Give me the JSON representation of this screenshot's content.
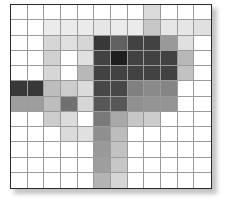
{
  "figure": {
    "kind": "grayscale-heatmap-image",
    "background_color": "#ffffff",
    "frame_border_color": "#2a2a2a",
    "gridline_color": "#9b9b9b",
    "shadow_color": "#b9b9b9"
  },
  "chart_data": {
    "type": "heatmap",
    "title": "",
    "subtitle": "",
    "xlabel": "",
    "ylabel": "",
    "grid": true,
    "legend": "none",
    "colormap": "grayscale",
    "value_range": [
      0,
      1
    ],
    "value_color_note": "0 = black, 1 = white",
    "rows": 12,
    "cols": 12,
    "x": [
      1,
      2,
      3,
      4,
      5,
      6,
      7,
      8,
      9,
      10,
      11,
      12
    ],
    "y": [
      1,
      2,
      3,
      4,
      5,
      6,
      7,
      8,
      9,
      10,
      11,
      12
    ],
    "xticklabels": [
      "",
      "",
      "",
      "",
      "",
      "",
      "",
      "",
      "",
      "",
      "",
      ""
    ],
    "yticklabels": [
      "",
      "",
      "",
      "",
      "",
      "",
      "",
      "",
      "",
      "",
      "",
      ""
    ],
    "values": [
      [
        1.0,
        1.0,
        1.0,
        1.0,
        1.0,
        1.0,
        1.0,
        1.0,
        0.86,
        1.0,
        1.0,
        1.0
      ],
      [
        1.0,
        1.0,
        0.92,
        0.92,
        0.92,
        0.9,
        0.92,
        0.92,
        0.78,
        0.9,
        0.9,
        0.88
      ],
      [
        1.0,
        1.0,
        0.84,
        0.88,
        0.84,
        0.22,
        0.38,
        0.26,
        0.26,
        0.6,
        0.88,
        1.0
      ],
      [
        1.0,
        1.0,
        0.82,
        1.0,
        0.88,
        0.26,
        0.12,
        0.26,
        0.26,
        0.26,
        0.72,
        1.0
      ],
      [
        1.0,
        1.0,
        0.84,
        1.0,
        0.72,
        0.26,
        0.26,
        0.26,
        0.26,
        0.26,
        0.76,
        1.0
      ],
      [
        0.22,
        0.22,
        0.74,
        0.8,
        0.86,
        0.28,
        0.28,
        0.5,
        0.54,
        0.52,
        1.0,
        1.0
      ],
      [
        0.62,
        0.62,
        0.74,
        0.44,
        0.84,
        0.34,
        0.34,
        0.56,
        0.58,
        0.58,
        1.0,
        1.0
      ],
      [
        1.0,
        1.0,
        0.8,
        0.86,
        1.0,
        0.48,
        0.66,
        0.78,
        0.8,
        1.0,
        1.0,
        1.0
      ],
      [
        1.0,
        1.0,
        1.0,
        0.86,
        0.88,
        0.56,
        0.74,
        1.0,
        1.0,
        1.0,
        1.0,
        1.0
      ],
      [
        1.0,
        1.0,
        1.0,
        1.0,
        1.0,
        0.6,
        0.76,
        1.0,
        1.0,
        1.0,
        1.0,
        1.0
      ],
      [
        1.0,
        1.0,
        1.0,
        1.0,
        1.0,
        0.62,
        0.78,
        1.0,
        1.0,
        1.0,
        1.0,
        1.0
      ],
      [
        1.0,
        1.0,
        1.0,
        1.0,
        1.0,
        0.7,
        0.84,
        1.0,
        1.0,
        1.0,
        1.0,
        1.0
      ]
    ]
  }
}
